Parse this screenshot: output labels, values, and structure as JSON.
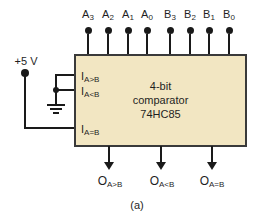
{
  "colors": {
    "chip_fill": "#f2e6c2",
    "chip_border": "#3a3a3a",
    "wire": "#1a1a1a",
    "text": "#1f1f1f",
    "background": "#ffffff"
  },
  "power": {
    "label": "+5 V"
  },
  "chip": {
    "line1": "4-bit",
    "line2": "comparator",
    "line3": "74HC85"
  },
  "top_pins": [
    {
      "main": "A",
      "sub": "3"
    },
    {
      "main": "A",
      "sub": "2"
    },
    {
      "main": "A",
      "sub": "1"
    },
    {
      "main": "A",
      "sub": "0"
    },
    {
      "main": "B",
      "sub": "3"
    },
    {
      "main": "B",
      "sub": "2"
    },
    {
      "main": "B",
      "sub": "1"
    },
    {
      "main": "B",
      "sub": "0"
    }
  ],
  "cascade_inputs": [
    {
      "main": "I",
      "sub": "A>B"
    },
    {
      "main": "I",
      "sub": "A<B"
    },
    {
      "main": "I",
      "sub": "A=B"
    }
  ],
  "outputs": [
    {
      "main": "O",
      "sub": "A>B"
    },
    {
      "main": "O",
      "sub": "A<B"
    },
    {
      "main": "O",
      "sub": "A=B"
    }
  ],
  "caption": "(a)"
}
